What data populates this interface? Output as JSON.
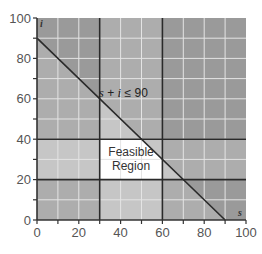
{
  "chart_data": {
    "type": "area",
    "title": "",
    "xlabel": "s",
    "ylabel": "i",
    "xlim": [
      0,
      100
    ],
    "ylim": [
      0,
      100
    ],
    "x_ticks": [
      0,
      20,
      40,
      60,
      80,
      100
    ],
    "y_ticks": [
      0,
      20,
      40,
      60,
      80,
      100
    ],
    "x_tick_labels": [
      "0",
      "20",
      "40",
      "60",
      "80",
      "100"
    ],
    "y_tick_labels": [
      "0",
      "20",
      "40",
      "60",
      "80",
      "100"
    ],
    "minor_tick_step": 10,
    "grid": true,
    "constraints": [
      {
        "expr": "s >= 30",
        "type": "vertical",
        "value": 30
      },
      {
        "expr": "s <= 60",
        "type": "vertical",
        "value": 60
      },
      {
        "expr": "i >= 20",
        "type": "horizontal",
        "value": 20
      },
      {
        "expr": "i <= 40",
        "type": "horizontal",
        "value": 40
      },
      {
        "expr": "s + i <= 90",
        "type": "line",
        "points": [
          [
            0,
            90
          ],
          [
            90,
            0
          ]
        ]
      }
    ],
    "annotations": [
      {
        "text_parts": [
          "s",
          " + ",
          "i",
          " ≤ ",
          " 90"
        ],
        "text": "s + i ≤ 90",
        "at": [
          43,
          63
        ]
      },
      {
        "text": "Feasible Region",
        "lines": [
          "Feasible",
          "Region"
        ],
        "at": [
          45,
          30
        ]
      }
    ],
    "feasible_region": {
      "s": [
        30,
        60
      ],
      "i": [
        20,
        40
      ],
      "extra": "s + i <= 90"
    },
    "shade_colors": {
      "feasible": "#ffffff",
      "violations_1": "#c6c6c6",
      "violations_2": "#adadad",
      "violations_3": "#9a9a9a"
    },
    "line_color": "#2a2a2a",
    "grid_color": "#e4e4e4"
  }
}
